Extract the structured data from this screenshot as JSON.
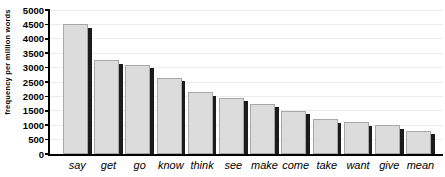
{
  "chart_data": {
    "type": "bar",
    "title": "",
    "xlabel": "",
    "ylabel": "frequency per million words",
    "categories": [
      "say",
      "get",
      "go",
      "know",
      "think",
      "see",
      "make",
      "come",
      "take",
      "want",
      "give",
      "mean"
    ],
    "values": [
      4500,
      3250,
      3100,
      2650,
      2150,
      1950,
      1750,
      1500,
      1200,
      1100,
      1000,
      800
    ],
    "ylim": [
      0,
      5000
    ],
    "ytick_step": 500,
    "yticks": [
      0,
      500,
      1000,
      1500,
      2000,
      2500,
      3000,
      3500,
      4000,
      4500,
      5000
    ],
    "grid": true,
    "legend": "none",
    "bar_style": "gray-with-black-drop-shadow"
  },
  "colors": {
    "background": "#ffffff",
    "bar_fill": "#dcdcdc",
    "bar_border": "#a8a8a8",
    "bar_shadow": "#1b1b1b",
    "axis": "#000000",
    "gridline": "#ececec",
    "text": "#000000"
  }
}
